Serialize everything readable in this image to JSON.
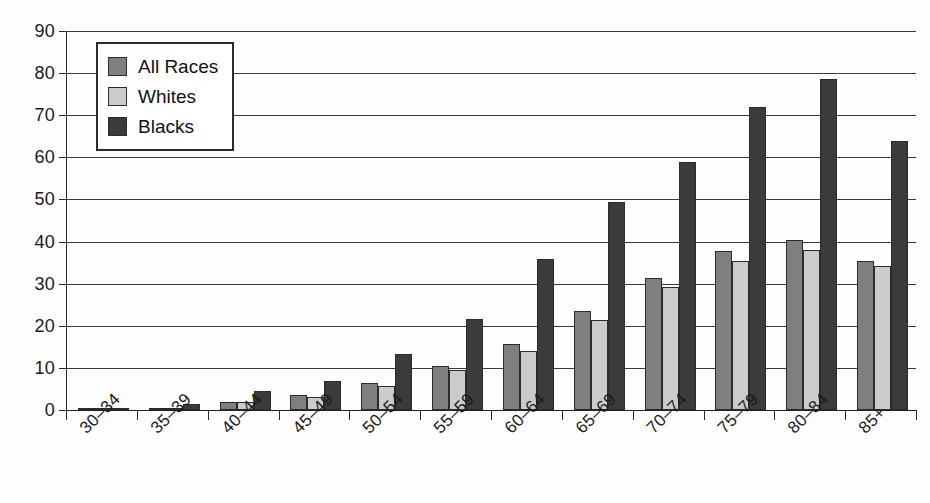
{
  "chart_data": {
    "type": "bar",
    "title": "",
    "xlabel": "",
    "ylabel": "",
    "ylim": [
      0,
      90
    ],
    "yticks": [
      0,
      10,
      20,
      30,
      40,
      50,
      60,
      70,
      80,
      90
    ],
    "grid": true,
    "legend_position": "top-left",
    "categories": [
      "30–34",
      "35–39",
      "40–44",
      "45–49",
      "50–54",
      "55–59",
      "60–64",
      "65–69",
      "70–74",
      "75–79",
      "80–84",
      "85+"
    ],
    "series": [
      {
        "name": "All Races",
        "color": "#7f7f7f",
        "values": [
          0.4,
          0.5,
          1.9,
          3.5,
          6.3,
          10.4,
          15.7,
          23.6,
          31.3,
          37.8,
          40.4,
          35.4
        ]
      },
      {
        "name": "Whites",
        "color": "#cbcbcb",
        "values": [
          0.4,
          0.5,
          2.0,
          3.2,
          5.6,
          9.4,
          14.1,
          21.3,
          29.1,
          35.5,
          38.0,
          34.1
        ]
      },
      {
        "name": "Blacks",
        "color": "#3b3b3b",
        "values": [
          0.5,
          1.4,
          4.6,
          6.8,
          13.3,
          21.7,
          35.8,
          49.3,
          58.9,
          71.9,
          78.5,
          63.9
        ]
      }
    ]
  },
  "legend": {
    "items": [
      {
        "label": "All Races",
        "swatch": "legend-swatch-all-races"
      },
      {
        "label": "Whites",
        "swatch": "legend-swatch-whites"
      },
      {
        "label": "Blacks",
        "swatch": "legend-swatch-blacks"
      }
    ]
  },
  "axes": {
    "y_tick_labels": [
      "90",
      "80",
      "70",
      "60",
      "50",
      "40",
      "30",
      "20",
      "10",
      "0"
    ]
  }
}
